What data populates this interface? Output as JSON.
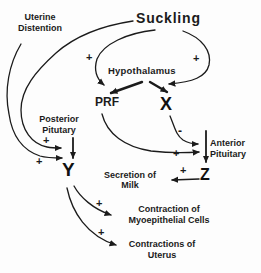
{
  "diagram": {
    "title": "Suckling",
    "nodes": {
      "uterine_distention": {
        "line1": "Uterine",
        "line2": "Distention"
      },
      "suckling": "Suckling",
      "hypothalamus": "Hypothalamus",
      "prf": "PRF",
      "x": "X",
      "posterior_pituitary": {
        "line1": "Posterior",
        "line2": "Pitutary"
      },
      "anterior_pituitary": {
        "line1": "Anterior",
        "line2": "Pituitary"
      },
      "y": "Y",
      "z": "Z",
      "secretion_of_milk": {
        "line1": "Secretion of",
        "line2": "Milk"
      },
      "contraction_myoepithelial": {
        "line1": "Contraction of",
        "line2": "Myoepithelial Cells"
      },
      "contractions_uterus": {
        "line1": "Contractions of",
        "line2": "Uterus"
      }
    },
    "signs": {
      "suckling_to_hypothalamus_left": "+",
      "suckling_to_hypothalamus_right": "+",
      "to_posterior_pituitary_upper": "+",
      "to_posterior_pituitary_lower": "+",
      "x_to_anterior_pituitary": "-",
      "prf_to_anterior_pituitary": "+",
      "z_to_secretion": "+",
      "y_to_myoepithelial": "+",
      "y_to_uterus": "+"
    },
    "edges": [
      {
        "from": "Suckling",
        "to": "Hypothalamus",
        "sign": "+",
        "side": "left"
      },
      {
        "from": "Suckling",
        "to": "Hypothalamus",
        "sign": "+",
        "side": "right"
      },
      {
        "from": "Suckling",
        "to": "Posterior Pituitary",
        "sign": "+"
      },
      {
        "from": "Uterine Distention",
        "to": "Posterior Pituitary",
        "sign": "+"
      },
      {
        "from": "Hypothalamus",
        "to": "PRF"
      },
      {
        "from": "Hypothalamus",
        "to": "X"
      },
      {
        "from": "PRF",
        "to": "Anterior Pituitary",
        "sign": "+"
      },
      {
        "from": "X",
        "to": "Anterior Pituitary",
        "sign": "-"
      },
      {
        "from": "Anterior Pituitary",
        "to": "Z"
      },
      {
        "from": "Posterior Pituitary",
        "to": "Y"
      },
      {
        "from": "Z",
        "to": "Secretion of Milk",
        "sign": "+"
      },
      {
        "from": "Y",
        "to": "Contraction of Myoepithelial Cells",
        "sign": "+"
      },
      {
        "from": "Y",
        "to": "Contractions of Uterus",
        "sign": "+"
      }
    ],
    "colors": {
      "ink": "#1b1b1b",
      "background": "#fdfdfd"
    }
  }
}
